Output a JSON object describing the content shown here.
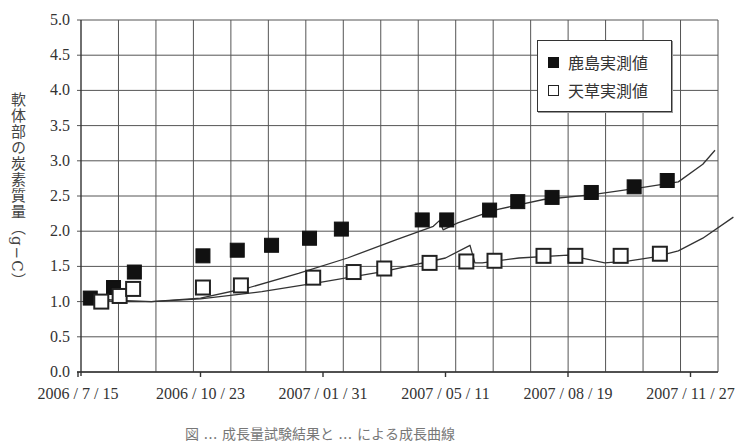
{
  "chart_data": {
    "type": "scatter",
    "title": "",
    "caption": "図 … 成長量試験結果と … による成長曲線",
    "xlabel": "",
    "ylabel": "軟体部の炭素質量（g−C）",
    "ylim": [
      0.0,
      5.0
    ],
    "yticks": [
      "0.0",
      "0.5",
      "1.0",
      "1.5",
      "2.0",
      "2.5",
      "3.0",
      "3.5",
      "4.0",
      "4.5",
      "5.0"
    ],
    "xticks": [
      "2006 / 7 / 15",
      "2006 / 10 / 23",
      "2007 / 01 / 31",
      "2007 / 05 / 11",
      "2007 / 08 / 19",
      "2007 / 11 / 27"
    ],
    "xtick_days": [
      0,
      100,
      200,
      300,
      400,
      500
    ],
    "xlim_days": [
      0,
      520
    ],
    "grid": true,
    "legend_position": "upper right",
    "series": [
      {
        "name": "鹿島実測値",
        "marker": "filled-square",
        "color": "#111111",
        "x_days": [
          10,
          29,
          46,
          102,
          130,
          158,
          189,
          215,
          281,
          301,
          336,
          359,
          387,
          419,
          454,
          481
        ],
        "values": [
          1.05,
          1.2,
          1.42,
          1.65,
          1.73,
          1.8,
          1.9,
          2.03,
          2.16,
          2.16,
          2.3,
          2.42,
          2.48,
          2.55,
          2.63,
          2.72
        ]
      },
      {
        "name": "天草実測値",
        "marker": "open-square",
        "color": "#222222",
        "x_days": [
          19,
          34,
          45,
          102,
          133,
          192,
          225,
          250,
          287,
          317,
          340,
          380,
          406,
          443,
          475
        ],
        "values": [
          1.0,
          1.08,
          1.18,
          1.2,
          1.23,
          1.34,
          1.42,
          1.47,
          1.55,
          1.57,
          1.58,
          1.65,
          1.65,
          1.65,
          1.68
        ]
      }
    ],
    "curves": [
      {
        "name": "鹿島計算値",
        "x_days": [
          10,
          30,
          60,
          100,
          140,
          180,
          220,
          260,
          290,
          295,
          298,
          310,
          340,
          380,
          420,
          460,
          490,
          510,
          520
        ],
        "values": [
          1.05,
          1.02,
          1.0,
          1.05,
          1.2,
          1.4,
          1.62,
          1.88,
          2.07,
          2.15,
          2.02,
          2.12,
          2.3,
          2.45,
          2.52,
          2.62,
          2.7,
          2.95,
          3.15
        ]
      },
      {
        "name": "天草計算値",
        "x_days": [
          10,
          30,
          60,
          100,
          150,
          200,
          250,
          300,
          320,
          324,
          330,
          360,
          400,
          430,
          450,
          470,
          490,
          510,
          535
        ],
        "values": [
          1.05,
          1.0,
          1.0,
          1.04,
          1.14,
          1.28,
          1.43,
          1.62,
          1.8,
          1.55,
          1.55,
          1.62,
          1.66,
          1.55,
          1.58,
          1.63,
          1.72,
          1.9,
          2.2
        ]
      }
    ]
  },
  "legend": {
    "items": [
      {
        "label": "鹿島実測値",
        "marker": "filled-square"
      },
      {
        "label": "天草実測値",
        "marker": "open-square"
      }
    ]
  }
}
